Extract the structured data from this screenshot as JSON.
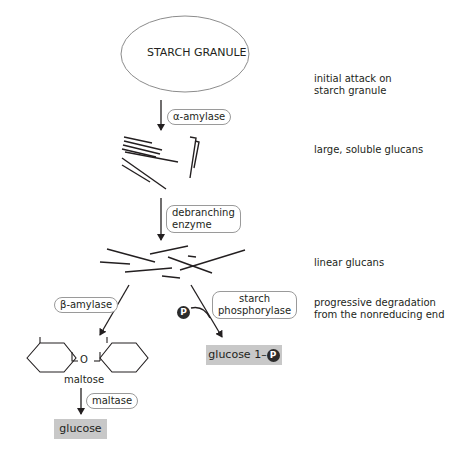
{
  "granule": {
    "label": "STARCH GRANULE"
  },
  "enzymes": {
    "alpha_amylase": "α-amylase",
    "debranching_line1": "debranching",
    "debranching_line2": "enzyme",
    "beta_amylase": "β-amylase",
    "phosphorylase_line1": "starch",
    "phosphorylase_line2": "phosphorylase",
    "maltase": "maltase"
  },
  "products": {
    "maltose": "maltose",
    "glucose": "glucose",
    "glucose_1p_prefix": "glucose 1–",
    "phosphate_symbol": "P",
    "ring_linker": "O"
  },
  "stages": [
    {
      "line1": "initial attack on",
      "line2": "starch granule"
    },
    {
      "line1": "large, soluble glucans",
      "line2": ""
    },
    {
      "line1": "linear glucans",
      "line2": ""
    },
    {
      "line1": "progressive degradation",
      "line2": "from the nonreducing end"
    }
  ],
  "colors": {
    "product_box": "#c8c8c8",
    "ink": "#231f20",
    "pill_border": "#9a9a9a"
  }
}
